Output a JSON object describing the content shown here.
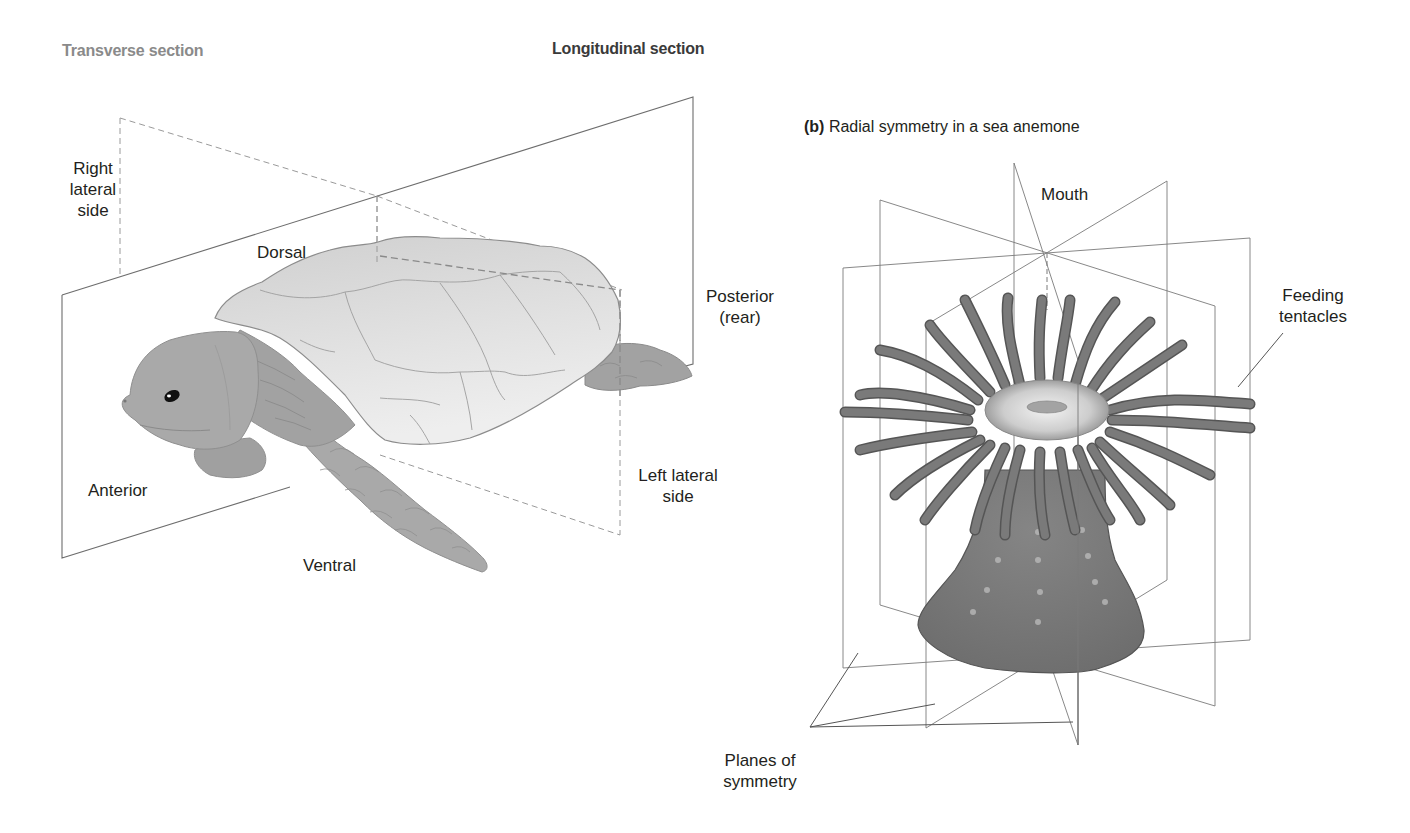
{
  "figure": {
    "part_a": {
      "heading_transverse": "Transverse section",
      "heading_longitudinal": "Longitudinal section",
      "labels": {
        "right_lateral_side": [
          "Right",
          "lateral",
          "side"
        ],
        "dorsal": "Dorsal",
        "posterior": [
          "Posterior",
          "(rear)"
        ],
        "anterior": "Anterior",
        "ventral": "Ventral",
        "left_lateral_side": [
          "Left lateral",
          "side"
        ]
      },
      "subject": "turtle"
    },
    "part_b": {
      "caption_letter": "(b)",
      "caption_text": " Radial symmetry in a sea anemone",
      "labels": {
        "mouth": "Mouth",
        "feeding_tentacles": [
          "Feeding",
          "tentacles"
        ],
        "planes_of_symmetry": [
          "Planes of",
          "symmetry"
        ]
      },
      "subject": "sea-anemone"
    }
  },
  "colors": {
    "line": "#6d6d6d",
    "dashed": "#9a9a9a",
    "shell": "#d6d6d6",
    "shell_edge": "#8c8c8c",
    "skin": "#a9a9a9",
    "skin_dark": "#8f8f8f",
    "tentacle": "#6f6f6f",
    "anemone_body": "#7a7a7a",
    "oral_disc": "#cfcfcf",
    "muted_heading": "#8a8a8a"
  }
}
